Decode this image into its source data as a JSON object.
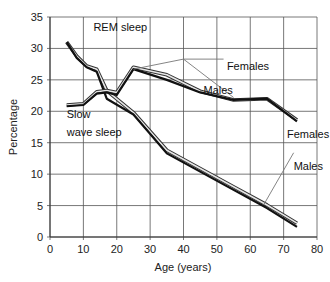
{
  "chart_data": {
    "type": "line",
    "title": "",
    "xlabel": "Age (years)",
    "ylabel": "Percentage",
    "xlim": [
      0,
      80
    ],
    "ylim": [
      0,
      35
    ],
    "xticks": [
      0,
      10,
      20,
      30,
      40,
      50,
      60,
      70,
      80
    ],
    "yticks": [
      0,
      5,
      10,
      15,
      20,
      25,
      30,
      35
    ],
    "grid": true,
    "legend": "none (inline annotations)",
    "series": [
      {
        "name": "REM sleep - Females",
        "style": "double-outline",
        "x": [
          5,
          8,
          11,
          14,
          17,
          25,
          35,
          45,
          55,
          65,
          74
        ],
        "y": [
          31,
          28.8,
          27.2,
          26.7,
          23.3,
          19.8,
          13.8,
          10.9,
          8.0,
          5.1,
          2.2
        ]
      },
      {
        "name": "REM sleep - Males",
        "style": "solid-black",
        "x": [
          5,
          8,
          11,
          14,
          17,
          25,
          35,
          45,
          55,
          65,
          74
        ],
        "y": [
          31,
          28.5,
          27,
          26.3,
          22.0,
          19.5,
          13.3,
          10.4,
          7.5,
          4.6,
          1.6
        ]
      },
      {
        "name": "Slow wave sleep - Females",
        "style": "double-outline",
        "x": [
          5,
          10,
          14,
          17,
          20,
          25,
          35,
          45,
          55,
          65,
          74
        ],
        "y": [
          21,
          21.2,
          23.1,
          23.3,
          23.0,
          27.0,
          25.8,
          23.2,
          21.8,
          22.0,
          18.6
        ]
      },
      {
        "name": "Slow wave sleep - Males",
        "style": "solid-black",
        "x": [
          5,
          10,
          14,
          17,
          20,
          25,
          35,
          45,
          55,
          65,
          74
        ],
        "y": [
          20.8,
          21.0,
          22.8,
          23.0,
          22.6,
          26.7,
          25.0,
          23.0,
          21.8,
          22.0,
          18.4
        ]
      }
    ],
    "annotations": [
      {
        "text": "REM sleep",
        "x": 13,
        "y": 32.7
      },
      {
        "text": "Slow",
        "x": 5,
        "y": 19
      },
      {
        "text": "wave sleep",
        "x": 5,
        "y": 16
      },
      {
        "text": "Females",
        "x": 53,
        "y": 26.5
      },
      {
        "text": "Males",
        "x": 46,
        "y": 22.7
      },
      {
        "text": "Females",
        "x": 71,
        "y": 15.7
      },
      {
        "text": "Males",
        "x": 73,
        "y": 10.7
      }
    ]
  }
}
